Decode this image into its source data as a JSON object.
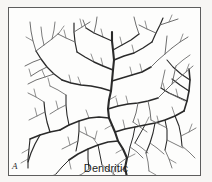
{
  "figure": {
    "panel_letter": "A",
    "caption": "Dendritic",
    "background_color": "#f7f6f4",
    "panel_color": "#fdfdfc",
    "frame_color": "#5d5d5d",
    "ink_color": "#2a2a2a",
    "fine_ink_color": "#6e6e6e",
    "illustration_name": "dendritic-drainage-pattern"
  },
  "chart_data": {
    "type": "diagram",
    "title": "Dendritic",
    "subtitle": "",
    "xlabel": "",
    "ylabel": "",
    "legend": [],
    "annotations": [
      "A",
      "Dendritic"
    ],
    "viewbox": [
      0,
      0,
      193,
      169
    ],
    "trunk": {
      "name": "main-trunk",
      "stroke_width": 2.1,
      "path": "M 118 169 L 116 160 L 118 150 L 114 141 L 109 133 L 106 124 L 103 117 L 100 110 L 99 101 L 100 92 L 102 83 L 103 73 L 104 62 L 105 52 L 104 42 L 103 33 L 103 24"
    },
    "branches": [
      {
        "name": "trunk-branch-right-lower",
        "order": 2,
        "stroke_width": 1.7,
        "path": "M 106 124 L 116 121 L 126 119 L 136 117 L 146 115 L 156 112 L 166 108 L 175 103"
      },
      {
        "name": "trunk-branch-left-lower",
        "order": 2,
        "stroke_width": 1.6,
        "path": "M 109 133 L 99 134 L 89 137 L 79 141 L 69 146 L 60 152"
      },
      {
        "name": "trunk-branch-left-mid",
        "order": 2,
        "stroke_width": 1.6,
        "path": "M 100 110 L 90 109 L 80 110 L 70 113 L 60 117 L 51 122"
      },
      {
        "name": "trunk-branch-right-mid",
        "order": 2,
        "stroke_width": 1.6,
        "path": "M 99 101 L 109 98 L 119 96 L 129 95 L 139 93 L 149 90"
      },
      {
        "name": "trunk-branch-left-upper",
        "order": 2,
        "stroke_width": 1.5,
        "path": "M 102 83 L 92 80 L 82 78 L 72 77 L 62 75 L 53 72"
      },
      {
        "name": "trunk-branch-right-upper",
        "order": 2,
        "stroke_width": 1.5,
        "path": "M 103 73 L 113 70 L 123 67 L 133 64 L 142 59"
      },
      {
        "name": "trunk-branch-left-top",
        "order": 2,
        "stroke_width": 1.4,
        "path": "M 104 62 L 94 58 L 85 54 L 76 49 L 68 44"
      },
      {
        "name": "trunk-branch-right-top",
        "order": 2,
        "stroke_width": 1.4,
        "path": "M 105 52 L 115 48 L 125 45 L 134 40 L 143 34"
      },
      {
        "name": "trunk-branch-left-crown",
        "order": 2,
        "stroke_width": 1.3,
        "path": "M 103 33 L 94 29 L 85 25 L 77 20"
      },
      {
        "name": "trunk-branch-right-crown",
        "order": 2,
        "stroke_width": 1.3,
        "path": "M 104 42 L 113 37 L 122 32 L 130 26"
      },
      {
        "name": "east-trunk",
        "order": 2,
        "stroke_width": 1.6,
        "path": "M 175 103 L 178 93 L 180 83 L 181 72 L 180 61"
      },
      {
        "name": "east-branch-a",
        "order": 3,
        "stroke_width": 1.2,
        "path": "M 178 93 L 169 89 L 160 85 L 152 80"
      },
      {
        "name": "east-branch-b",
        "order": 3,
        "stroke_width": 1.2,
        "path": "M 180 83 L 171 77 L 163 71"
      },
      {
        "name": "east-branch-c",
        "order": 3,
        "stroke_width": 1.1,
        "path": "M 181 72 L 172 66 L 164 59 L 158 52"
      },
      {
        "name": "east-branch-d",
        "order": 3,
        "stroke_width": 1.1,
        "path": "M 166 108 L 170 118 L 172 128 L 173 138"
      },
      {
        "name": "east-branch-e",
        "order": 3,
        "stroke_width": 1.1,
        "path": "M 156 112 L 158 122 L 158 132 L 156 142"
      },
      {
        "name": "east-branch-f",
        "order": 3,
        "stroke_width": 1.1,
        "path": "M 146 115 L 144 125 L 141 135 L 137 145"
      },
      {
        "name": "east-branch-g",
        "order": 3,
        "stroke_width": 1.0,
        "path": "M 136 117 L 131 126 L 126 135"
      },
      {
        "name": "east-branch-h",
        "order": 3,
        "stroke_width": 1.0,
        "path": "M 126 119 L 124 129 L 121 139 L 119 149"
      },
      {
        "name": "west-trunk",
        "order": 2,
        "stroke_width": 1.5,
        "path": "M 51 122 L 41 124 L 31 127 L 21 131"
      },
      {
        "name": "west-branch-a",
        "order": 3,
        "stroke_width": 1.2,
        "path": "M 41 124 L 38 114 L 36 104 L 35 94"
      },
      {
        "name": "west-branch-b",
        "order": 3,
        "stroke_width": 1.2,
        "path": "M 31 127 L 26 136 L 22 145 L 19 154"
      },
      {
        "name": "west-branch-c",
        "order": 3,
        "stroke_width": 1.1,
        "path": "M 60 117 L 58 107 L 57 97 L 57 87"
      },
      {
        "name": "west-branch-d",
        "order": 3,
        "stroke_width": 1.1,
        "path": "M 70 113 L 70 123 L 69 133 L 67 143"
      },
      {
        "name": "west-branch-e",
        "order": 3,
        "stroke_width": 1.1,
        "path": "M 79 141 L 79 151 L 80 161"
      },
      {
        "name": "west-branch-f",
        "order": 3,
        "stroke_width": 1.0,
        "path": "M 89 137 L 91 147 L 93 157"
      },
      {
        "name": "west-branch-g",
        "order": 3,
        "stroke_width": 1.0,
        "path": "M 60 152 L 53 159 L 47 166"
      },
      {
        "name": "nw-trunk",
        "order": 3,
        "stroke_width": 1.3,
        "path": "M 53 72 L 45 66 L 38 59 L 32 51 L 27 43"
      },
      {
        "name": "nw-branch-a",
        "order": 4,
        "stroke_width": 1.0,
        "path": "M 45 66 L 36 69 L 27 72 L 19 76"
      },
      {
        "name": "nw-branch-b",
        "order": 4,
        "stroke_width": 1.0,
        "path": "M 38 59 L 30 63 L 22 68"
      },
      {
        "name": "nw-branch-c",
        "order": 4,
        "stroke_width": 1.0,
        "path": "M 32 51 L 24 54 L 16 58"
      },
      {
        "name": "nw-branch-d",
        "order": 4,
        "stroke_width": 1.0,
        "path": "M 27 43 L 24 33 L 22 23 L 21 14"
      },
      {
        "name": "nw-branch-e",
        "order": 4,
        "stroke_width": 1.0,
        "path": "M 27 43 L 35 37 L 43 31 L 50 25"
      },
      {
        "name": "nw-branch-f",
        "order": 5,
        "stroke_width": 0.9,
        "path": "M 43 31 L 45 22 L 46 14"
      },
      {
        "name": "nw-branch-g",
        "order": 5,
        "stroke_width": 0.9,
        "path": "M 35 37 L 33 28 L 32 19"
      },
      {
        "name": "n-trunk",
        "order": 3,
        "stroke_width": 1.2,
        "path": "M 68 44 L 66 34 L 65 24 L 65 15"
      },
      {
        "name": "n-branch-a",
        "order": 4,
        "stroke_width": 1.0,
        "path": "M 66 34 L 57 30 L 49 26"
      },
      {
        "name": "n-branch-b",
        "order": 4,
        "stroke_width": 1.0,
        "path": "M 65 24 L 73 19 L 81 14"
      },
      {
        "name": "n-branch-c",
        "order": 4,
        "stroke_width": 1.0,
        "path": "M 77 20 L 74 12"
      },
      {
        "name": "n-branch-d",
        "order": 4,
        "stroke_width": 1.0,
        "path": "M 85 25 L 87 16 L 88 9"
      },
      {
        "name": "ne-trunk",
        "order": 3,
        "stroke_width": 1.2,
        "path": "M 143 34 L 147 25 L 151 17 L 154 10"
      },
      {
        "name": "ne-branch-a",
        "order": 4,
        "stroke_width": 1.0,
        "path": "M 147 25 L 138 21 L 130 17"
      },
      {
        "name": "ne-branch-b",
        "order": 4,
        "stroke_width": 1.0,
        "path": "M 151 17 L 160 14 L 169 11"
      },
      {
        "name": "ne-branch-c",
        "order": 4,
        "stroke_width": 1.0,
        "path": "M 130 26 L 127 17 L 125 9"
      },
      {
        "name": "ne-branch-d",
        "order": 4,
        "stroke_width": 1.0,
        "path": "M 142 59 L 149 52 L 156 46 L 163 40"
      },
      {
        "name": "ne-branch-e",
        "order": 4,
        "stroke_width": 1.0,
        "path": "M 156 46 L 157 37 L 158 28"
      },
      {
        "name": "ne-branch-f",
        "order": 4,
        "stroke_width": 1.0,
        "path": "M 163 40 L 171 34 L 179 29"
      },
      {
        "name": "ne-branch-g",
        "order": 4,
        "stroke_width": 1.0,
        "path": "M 149 90 L 156 83 L 163 76 L 170 70"
      },
      {
        "name": "ne-branch-h",
        "order": 4,
        "stroke_width": 1.0,
        "path": "M 163 76 L 165 67 L 167 58"
      },
      {
        "name": "ne-branch-i",
        "order": 4,
        "stroke_width": 1.0,
        "path": "M 139 93 L 141 103 L 142 112"
      },
      {
        "name": "ne-branch-j",
        "order": 4,
        "stroke_width": 1.0,
        "path": "M 129 95 L 127 105 L 124 114"
      },
      {
        "name": "sw-trunk",
        "order": 3,
        "stroke_width": 1.1,
        "path": "M 21 131 L 20 141 L 19 151 L 19 160"
      },
      {
        "name": "sw-branch-a",
        "order": 4,
        "stroke_width": 0.9,
        "path": "M 35 94 L 27 89 L 19 85"
      },
      {
        "name": "sw-branch-b",
        "order": 4,
        "stroke_width": 0.9,
        "path": "M 36 104 L 28 108 L 20 112"
      },
      {
        "name": "sw-branch-c",
        "order": 4,
        "stroke_width": 0.9,
        "path": "M 57 87 L 49 82 L 41 78"
      },
      {
        "name": "sw-branch-d",
        "order": 4,
        "stroke_width": 0.9,
        "path": "M 57 97 L 49 101 L 41 106"
      },
      {
        "name": "sw-branch-e",
        "order": 4,
        "stroke_width": 0.9,
        "path": "M 69 133 L 61 137 L 53 141"
      },
      {
        "name": "sw-branch-f",
        "order": 4,
        "stroke_width": 0.9,
        "path": "M 70 123 L 78 127 L 86 131"
      },
      {
        "name": "sw-branch-g",
        "order": 4,
        "stroke_width": 0.9,
        "path": "M 80 161 L 73 166 L 67 169"
      },
      {
        "name": "sw-branch-h",
        "order": 4,
        "stroke_width": 0.9,
        "path": "M 93 157 L 100 162 L 106 167"
      },
      {
        "name": "se-branch-a",
        "order": 4,
        "stroke_width": 0.9,
        "path": "M 173 138 L 180 144 L 186 150"
      },
      {
        "name": "se-branch-b",
        "order": 4,
        "stroke_width": 0.9,
        "path": "M 172 128 L 180 124 L 187 120"
      },
      {
        "name": "se-branch-c",
        "order": 4,
        "stroke_width": 0.9,
        "path": "M 156 142 L 160 151 L 163 160"
      },
      {
        "name": "se-branch-d",
        "order": 4,
        "stroke_width": 0.9,
        "path": "M 158 132 L 166 136 L 174 140"
      },
      {
        "name": "se-branch-e",
        "order": 4,
        "stroke_width": 0.9,
        "path": "M 141 135 L 148 140 L 155 146"
      },
      {
        "name": "se-branch-f",
        "order": 4,
        "stroke_width": 0.9,
        "path": "M 137 145 L 139 154 L 140 163"
      },
      {
        "name": "se-branch-g",
        "order": 4,
        "stroke_width": 0.9,
        "path": "M 126 135 L 133 140 L 139 145"
      },
      {
        "name": "se-branch-h",
        "order": 4,
        "stroke_width": 0.9,
        "path": "M 119 149 L 112 154 L 106 159"
      },
      {
        "name": "se-branch-i",
        "order": 4,
        "stroke_width": 0.9,
        "path": "M 121 139 L 128 144 L 134 150"
      },
      {
        "name": "se-branch-j",
        "order": 4,
        "stroke_width": 0.9,
        "path": "M 124 114 L 131 119 L 138 124"
      },
      {
        "name": "se-branch-k",
        "order": 4,
        "stroke_width": 0.9,
        "path": "M 142 112 L 150 116 L 158 120"
      },
      {
        "name": "se-branch-l",
        "order": 4,
        "stroke_width": 0.9,
        "path": "M 170 70 L 177 64 L 184 58"
      },
      {
        "name": "se-branch-m",
        "order": 4,
        "stroke_width": 0.9,
        "path": "M 167 58 L 174 52 L 181 47"
      },
      {
        "name": "se-branch-n",
        "order": 4,
        "stroke_width": 0.9,
        "path": "M 152 80 L 154 71 L 156 62"
      },
      {
        "name": "se-branch-o",
        "order": 4,
        "stroke_width": 0.9,
        "path": "M 160 85 L 168 89 L 176 93"
      }
    ],
    "twigs": [
      {
        "name": "twig-01",
        "path": "M 118 150 L 126 146"
      },
      {
        "name": "twig-02",
        "path": "M 114 141 L 107 145"
      },
      {
        "name": "twig-03",
        "path": "M 116 160 L 109 164"
      },
      {
        "name": "twig-04",
        "path": "M 103 117 L 96 121"
      },
      {
        "name": "twig-05",
        "path": "M 100 92 L 107 88"
      },
      {
        "name": "twig-06",
        "path": "M 116 121 L 114 112"
      },
      {
        "name": "twig-07",
        "path": "M 136 117 L 140 109"
      },
      {
        "name": "twig-08",
        "path": "M 166 108 L 163 99"
      },
      {
        "name": "twig-09",
        "path": "M 89 137 L 84 130"
      },
      {
        "name": "twig-10",
        "path": "M 60 152 L 62 161"
      },
      {
        "name": "twig-11",
        "path": "M 80 110 L 77 102"
      },
      {
        "name": "twig-12",
        "path": "M 119 96 L 117 88"
      },
      {
        "name": "twig-13",
        "path": "M 72 77 L 69 69"
      },
      {
        "name": "twig-14",
        "path": "M 123 67 L 121 59"
      },
      {
        "name": "twig-15",
        "path": "M 85 54 L 82 46"
      },
      {
        "name": "twig-16",
        "path": "M 125 45 L 123 37"
      },
      {
        "name": "twig-17",
        "path": "M 36 69 L 33 62"
      },
      {
        "name": "twig-18",
        "path": "M 22 68 L 20 61"
      },
      {
        "name": "twig-19",
        "path": "M 24 33 L 17 29"
      },
      {
        "name": "twig-20",
        "path": "M 50 25 L 55 18"
      },
      {
        "name": "twig-21",
        "path": "M 57 30 L 55 22"
      },
      {
        "name": "twig-22",
        "path": "M 73 19 L 71 11"
      },
      {
        "name": "twig-23",
        "path": "M 138 21 L 136 13"
      },
      {
        "name": "twig-24",
        "path": "M 160 14 L 163 7"
      },
      {
        "name": "twig-25",
        "path": "M 171 34 L 174 26"
      },
      {
        "name": "twig-26",
        "path": "M 177 64 L 180 56"
      },
      {
        "name": "twig-27",
        "path": "M 28 108 L 26 100"
      },
      {
        "name": "twig-28",
        "path": "M 49 101 L 47 93"
      },
      {
        "name": "twig-29",
        "path": "M 61 137 L 59 129"
      },
      {
        "name": "twig-30",
        "path": "M 20 141 L 13 145"
      },
      {
        "name": "twig-31",
        "path": "M 19 151 L 12 155"
      },
      {
        "name": "twig-32",
        "path": "M 180 124 L 183 116"
      },
      {
        "name": "twig-33",
        "path": "M 160 151 L 167 155"
      },
      {
        "name": "twig-34",
        "path": "M 140 163 L 147 167"
      },
      {
        "name": "twig-35",
        "path": "M 106 159 L 104 167"
      },
      {
        "name": "twig-36",
        "path": "M 131 119 L 129 111"
      },
      {
        "name": "twig-37",
        "path": "M 150 116 L 148 108"
      },
      {
        "name": "twig-38",
        "path": "M 41 78 L 39 70"
      },
      {
        "name": "twig-39",
        "path": "M 27 89 L 25 81"
      },
      {
        "name": "twig-40",
        "path": "M 86 131 L 88 123"
      },
      {
        "name": "twig-41",
        "path": "M 78 127 L 76 119"
      },
      {
        "name": "twig-42",
        "path": "M 94 29 L 92 21"
      },
      {
        "name": "twig-43",
        "path": "M 113 37 L 111 29"
      },
      {
        "name": "twig-44",
        "path": "M 94 58 L 92 50"
      },
      {
        "name": "twig-45",
        "path": "M 133 64 L 131 56"
      },
      {
        "name": "twig-46",
        "path": "M 62 75 L 60 67"
      },
      {
        "name": "twig-47",
        "path": "M 109 98 L 107 90"
      },
      {
        "name": "twig-48",
        "path": "M 156 83 L 154 75"
      },
      {
        "name": "twig-49",
        "path": "M 169 89 L 167 81"
      },
      {
        "name": "twig-50",
        "path": "M 47 166 L 41 169"
      }
    ]
  }
}
